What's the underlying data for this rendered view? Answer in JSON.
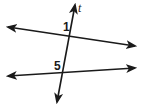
{
  "diagram": {
    "transversal": {
      "label": "t",
      "start": [
        57,
        102
      ],
      "end": [
        75,
        5
      ]
    },
    "lines": [
      {
        "name": "upper-line",
        "start": [
          8,
          27
        ],
        "end": [
          135,
          46
        ]
      },
      {
        "name": "lower-line",
        "start": [
          8,
          76
        ],
        "end": [
          135,
          68
        ]
      }
    ],
    "angles": [
      {
        "label": "1",
        "x": 63,
        "y": 31
      },
      {
        "label": "5",
        "x": 54,
        "y": 70
      }
    ],
    "colors": {
      "line": "#1a1a1a",
      "background": "#ffffff"
    }
  }
}
